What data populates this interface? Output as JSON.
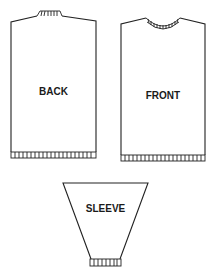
{
  "diagram": {
    "type": "sweater knitting schematic",
    "pieces": [
      {
        "id": "back",
        "label": "BACK"
      },
      {
        "id": "front",
        "label": "FRONT"
      },
      {
        "id": "sleeve",
        "label": "SLEEVE"
      }
    ]
  },
  "colors": {
    "line": "#222222",
    "background": "#ffffff"
  }
}
